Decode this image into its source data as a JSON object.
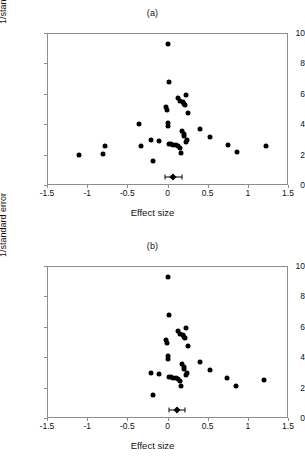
{
  "figure": {
    "xlabel": "Effect size",
    "ylabel": "1/standard error"
  },
  "panels": [
    {
      "title": "(a)"
    },
    {
      "title": "(b)"
    }
  ],
  "axis": {
    "xticks": [
      "-1.5",
      "-1",
      "-0.5",
      "0",
      "0.5",
      "1",
      "1.5"
    ],
    "xtick_values": [
      -1.5,
      -1,
      -0.5,
      0,
      0.5,
      1,
      1.5
    ],
    "yticks": [
      "0",
      "2",
      "4",
      "6",
      "8",
      "10"
    ],
    "ytick_values": [
      0,
      2,
      4,
      6,
      8,
      10
    ],
    "xlim": [
      -1.5,
      1.5
    ],
    "ylim": [
      0,
      10
    ]
  },
  "chart_data": [
    {
      "type": "scatter",
      "title": "(a)",
      "xlabel": "Effect size",
      "ylabel": "1/standard error",
      "xlim": [
        -1.5,
        1.5
      ],
      "ylim": [
        0,
        10
      ],
      "grid": false,
      "legend": null,
      "points": [
        [
          0.0,
          9.3
        ],
        [
          0.02,
          6.8
        ],
        [
          0.23,
          5.9
        ],
        [
          0.13,
          5.7
        ],
        [
          0.16,
          5.55
        ],
        [
          0.19,
          5.45
        ],
        [
          0.21,
          5.35
        ],
        [
          0.22,
          5.25
        ],
        [
          -0.02,
          5.1
        ],
        [
          -0.01,
          4.95
        ],
        [
          0.26,
          4.75
        ],
        [
          -0.35,
          4.0
        ],
        [
          0.01,
          4.05
        ],
        [
          0.0,
          3.88
        ],
        [
          0.4,
          3.7
        ],
        [
          0.18,
          3.55
        ],
        [
          0.21,
          3.35
        ],
        [
          0.2,
          3.2
        ],
        [
          0.53,
          3.15
        ],
        [
          0.24,
          2.95
        ],
        [
          -0.2,
          2.97
        ],
        [
          -0.11,
          2.92
        ],
        [
          0.23,
          2.82
        ],
        [
          -0.78,
          2.55
        ],
        [
          -0.33,
          2.55
        ],
        [
          1.22,
          2.55
        ],
        [
          0.02,
          2.72
        ],
        [
          0.04,
          2.7
        ],
        [
          0.07,
          2.62
        ],
        [
          0.1,
          2.62
        ],
        [
          0.75,
          2.65
        ],
        [
          0.13,
          2.55
        ],
        [
          0.16,
          2.45
        ],
        [
          0.87,
          2.18
        ],
        [
          0.17,
          2.1
        ],
        [
          -0.8,
          2.05
        ],
        [
          -1.1,
          2.0
        ],
        [
          -0.18,
          1.6
        ]
      ],
      "summary": {
        "estimate": 0.07,
        "ci_low": -0.03,
        "ci_high": 0.18,
        "y": 0.55
      }
    },
    {
      "type": "scatter",
      "title": "(b)",
      "xlabel": "Effect size",
      "ylabel": "1/standard error",
      "xlim": [
        -1.5,
        1.5
      ],
      "ylim": [
        0,
        10
      ],
      "grid": false,
      "legend": null,
      "points": [
        [
          0.0,
          9.3
        ],
        [
          0.02,
          6.8
        ],
        [
          0.23,
          5.9
        ],
        [
          0.13,
          5.7
        ],
        [
          0.16,
          5.55
        ],
        [
          0.19,
          5.45
        ],
        [
          0.21,
          5.35
        ],
        [
          0.22,
          5.25
        ],
        [
          -0.02,
          5.1
        ],
        [
          -0.01,
          4.95
        ],
        [
          0.26,
          4.75
        ],
        [
          0.01,
          4.05
        ],
        [
          0.0,
          3.88
        ],
        [
          0.4,
          3.7
        ],
        [
          0.18,
          3.55
        ],
        [
          0.21,
          3.35
        ],
        [
          0.2,
          3.2
        ],
        [
          0.53,
          3.15
        ],
        [
          0.24,
          2.95
        ],
        [
          -0.2,
          2.97
        ],
        [
          -0.11,
          2.92
        ],
        [
          0.23,
          2.82
        ],
        [
          1.2,
          2.52
        ],
        [
          0.02,
          2.72
        ],
        [
          0.04,
          2.7
        ],
        [
          0.07,
          2.62
        ],
        [
          0.1,
          2.62
        ],
        [
          0.74,
          2.62
        ],
        [
          0.13,
          2.55
        ],
        [
          0.16,
          2.45
        ],
        [
          0.85,
          2.1
        ],
        [
          0.17,
          2.08
        ],
        [
          -0.18,
          1.5
        ]
      ],
      "summary": {
        "estimate": 0.12,
        "ci_low": 0.02,
        "ci_high": 0.22,
        "y": 0.5
      }
    }
  ]
}
